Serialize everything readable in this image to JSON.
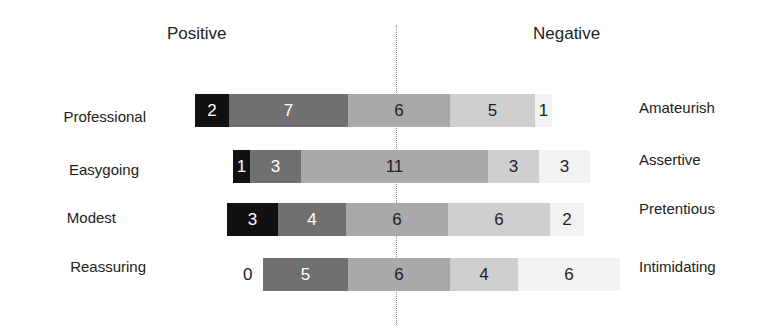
{
  "headers": {
    "positive": "Positive",
    "negative": "Negative"
  },
  "colors": [
    "#111111",
    "#707070",
    "#a9a9a9",
    "#cfcfcf",
    "#f2f2f2"
  ],
  "text_colors": [
    "#ffffff",
    "#ffffff",
    "#222222",
    "#222222",
    "#222222"
  ],
  "unit_px": 17,
  "chart_data": {
    "type": "bar",
    "orientation": "horizontal-stacked-diverging",
    "title": "",
    "categories": [
      "Professional / Amateurish",
      "Easygoing / Assertive",
      "Modest / Pretentious",
      "Reassuring / Intimidating"
    ],
    "left_labels": [
      "Professional",
      "Easygoing",
      "Modest",
      "Reassuring"
    ],
    "right_labels": [
      "Amateurish",
      "Assertive",
      "Pretentious",
      "Intimidating"
    ],
    "legend_position": "none",
    "axis_headers": [
      "Positive",
      "Negative"
    ],
    "series": [
      {
        "name": "Level 1 (most positive)",
        "values": [
          2,
          1,
          3,
          0
        ]
      },
      {
        "name": "Level 2",
        "values": [
          7,
          3,
          4,
          5
        ]
      },
      {
        "name": "Level 3 (neutral)",
        "values": [
          6,
          11,
          6,
          6
        ]
      },
      {
        "name": "Level 4",
        "values": [
          5,
          3,
          6,
          4
        ]
      },
      {
        "name": "Level 5 (most negative)",
        "values": [
          1,
          3,
          2,
          6
        ]
      }
    ]
  },
  "rows": [
    {
      "left": "Professional",
      "right": "Amateurish",
      "start": 195,
      "top": 94,
      "values": [
        "2",
        "7",
        "6",
        "5",
        "1"
      ]
    },
    {
      "left": "Easygoing",
      "right": "Assertive",
      "start": 233,
      "top": 150,
      "values": [
        "1",
        "3",
        "11",
        "3",
        "3"
      ]
    },
    {
      "left": "Modest",
      "right": "Pretentious",
      "start": 227,
      "top": 203,
      "values": [
        "3",
        "4",
        "6",
        "6",
        "2"
      ]
    },
    {
      "left": "Reassuring",
      "right": "Intimidating",
      "start": 263,
      "top": 258,
      "values": [
        "0",
        "5",
        "6",
        "4",
        "6"
      ]
    }
  ]
}
